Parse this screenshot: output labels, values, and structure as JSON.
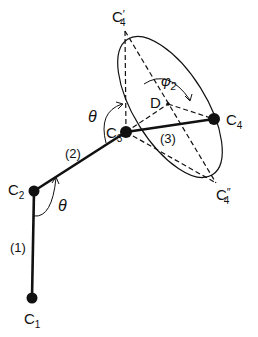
{
  "diagram": {
    "atoms": [
      {
        "id": "C1",
        "label": "C",
        "sub": "1",
        "x": 32,
        "y": 298
      },
      {
        "id": "C2",
        "label": "C",
        "sub": "2",
        "x": 34,
        "y": 191
      },
      {
        "id": "C3",
        "label": "C",
        "sub": "3",
        "x": 126,
        "y": 132
      },
      {
        "id": "C4",
        "label": "C",
        "sub": "4",
        "x": 214,
        "y": 119
      }
    ],
    "bonds": [
      {
        "label": "(1)"
      },
      {
        "label": "(2)"
      },
      {
        "label": "(3)"
      }
    ],
    "positions": {
      "c4_prime": {
        "label": "C",
        "sub": "4",
        "mark": "′"
      },
      "c4_double_prime": {
        "label": "C",
        "sub": "4",
        "mark": "″"
      },
      "d": {
        "label": "D"
      }
    },
    "angles": {
      "theta_1": "θ",
      "theta_2": "θ",
      "phi_2": {
        "label": "φ",
        "sub": "2"
      }
    },
    "colors": {
      "ink": "#111111",
      "background": "#ffffff"
    }
  }
}
